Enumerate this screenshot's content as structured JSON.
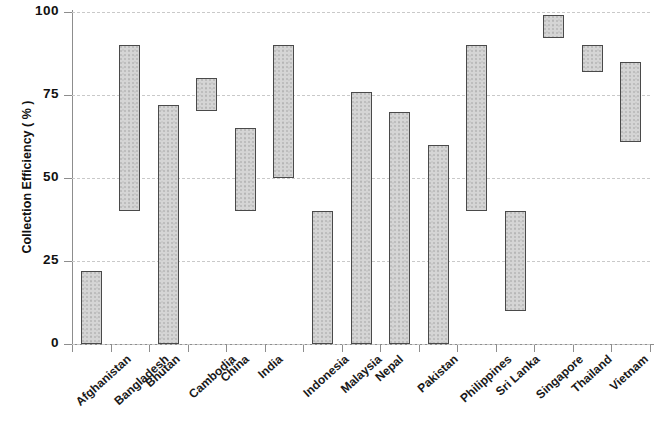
{
  "chart_data": {
    "type": "bar",
    "bar_style": "floating-range",
    "title": "",
    "xlabel": "",
    "ylabel": "Collection Efficiency ( % )",
    "ylim": [
      0,
      100
    ],
    "yticks": [
      0,
      25,
      50,
      75,
      100
    ],
    "ytick_labels": [
      "0",
      "25",
      "50",
      "75",
      "100"
    ],
    "grid": true,
    "grid_axis": "y",
    "grid_style": "dashed",
    "legend": false,
    "categories": [
      "Afghanistan",
      "Bangladesh",
      "Bhutan",
      "Cambodia",
      "China",
      "India",
      "Indonesia",
      "Malaysia",
      "Nepal",
      "Pakistan",
      "Philippines",
      "Sri Lanka",
      "Singapore",
      "Thailand",
      "Vietnam"
    ],
    "series": [
      {
        "name": "Collection Efficiency range",
        "low": [
          0,
          40,
          0,
          70,
          40,
          50,
          0,
          0,
          0,
          0,
          40,
          10,
          92,
          82,
          61
        ],
        "high": [
          22,
          90,
          72,
          80,
          65,
          90,
          40,
          76,
          70,
          60,
          90,
          40,
          99,
          90,
          85
        ]
      }
    ],
    "bar_fill_color": "#d5d5d5",
    "bar_edge_color": "#4a4a4a",
    "grid_color": "#c9c9c9",
    "axis_color": "#8d8d8d"
  }
}
